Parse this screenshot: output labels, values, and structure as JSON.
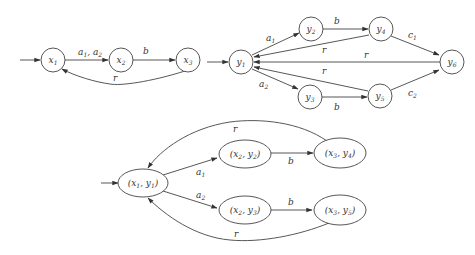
{
  "automaton_x": {
    "nodes": [
      {
        "id": "x1",
        "label": "x",
        "sub": "1"
      },
      {
        "id": "x2",
        "label": "x",
        "sub": "2"
      },
      {
        "id": "x3",
        "label": "x",
        "sub": "3"
      }
    ],
    "edges": [
      {
        "from": "start",
        "to": "x1",
        "label": ""
      },
      {
        "from": "x1",
        "to": "x2",
        "label": "a1, a2"
      },
      {
        "from": "x2",
        "to": "x3",
        "label": "b"
      },
      {
        "from": "x3",
        "to": "x1",
        "label": "r"
      }
    ],
    "edge_labels": {
      "x1_x2_a": "a",
      "x1_x2_s1": "1",
      "x1_x2_sep": ", ",
      "x1_x2_b": "a",
      "x1_x2_s2": "2",
      "x2_x3": "b",
      "x3_x1": "r"
    }
  },
  "automaton_y": {
    "nodes": [
      {
        "id": "y1",
        "label": "y",
        "sub": "1"
      },
      {
        "id": "y2",
        "label": "y",
        "sub": "2"
      },
      {
        "id": "y3",
        "label": "y",
        "sub": "3"
      },
      {
        "id": "y4",
        "label": "y",
        "sub": "4"
      },
      {
        "id": "y5",
        "label": "y",
        "sub": "5"
      },
      {
        "id": "y6",
        "label": "y",
        "sub": "6"
      }
    ],
    "edges": [
      {
        "from": "start",
        "to": "y1",
        "label": ""
      },
      {
        "from": "y1",
        "to": "y2",
        "label": "a1"
      },
      {
        "from": "y1",
        "to": "y3",
        "label": "a2"
      },
      {
        "from": "y2",
        "to": "y4",
        "label": "b"
      },
      {
        "from": "y3",
        "to": "y5",
        "label": "b"
      },
      {
        "from": "y4",
        "to": "y6",
        "label": "c1"
      },
      {
        "from": "y5",
        "to": "y6",
        "label": "c2"
      },
      {
        "from": "y4",
        "to": "y1",
        "label": "r"
      },
      {
        "from": "y6",
        "to": "y1",
        "label": "r"
      },
      {
        "from": "y5",
        "to": "y1",
        "label": "r"
      }
    ],
    "edge_labels": {
      "a": "a",
      "c": "c",
      "s1": "1",
      "s2": "2",
      "b": "b",
      "r": "r"
    }
  },
  "product": {
    "nodes": [
      {
        "id": "x1y1",
        "x": "x",
        "xs": "1",
        "y": "y",
        "ys": "1"
      },
      {
        "id": "x2y2",
        "x": "x",
        "xs": "2",
        "y": "y",
        "ys": "2"
      },
      {
        "id": "x3y4",
        "x": "x",
        "xs": "3",
        "y": "y",
        "ys": "4"
      },
      {
        "id": "x2y3",
        "x": "x",
        "xs": "2",
        "y": "y",
        "ys": "3"
      },
      {
        "id": "x3y5",
        "x": "x",
        "xs": "3",
        "y": "y",
        "ys": "5"
      }
    ],
    "edges": [
      {
        "from": "start",
        "to": "x1y1",
        "label": ""
      },
      {
        "from": "x1y1",
        "to": "x2y2",
        "label": "a1"
      },
      {
        "from": "x1y1",
        "to": "x2y3",
        "label": "a2"
      },
      {
        "from": "x2y2",
        "to": "x3y4",
        "label": "b"
      },
      {
        "from": "x2y3",
        "to": "x3y5",
        "label": "b"
      },
      {
        "from": "x3y4",
        "to": "x1y1",
        "label": "r"
      },
      {
        "from": "x3y5",
        "to": "x1y1",
        "label": "r"
      }
    ],
    "punct": {
      "open": "(",
      "comma": ", ",
      "close": ")"
    }
  }
}
